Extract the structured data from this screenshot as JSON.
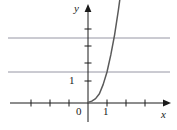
{
  "figure": {
    "title": "",
    "background_color": "#ffffff",
    "axis_color": "#1a1a1a",
    "grid_color": "#8a8a9a",
    "curve_color": "#5a5a5a"
  },
  "labels": {
    "y_axis": "y",
    "x_axis": "x",
    "origin": "0",
    "x_tick_one": "1",
    "y_tick_one": "1"
  },
  "chart_data": {
    "type": "line",
    "title": "",
    "xlabel": "x",
    "ylabel": "y",
    "xlim": [
      -3.7,
      4.1
    ],
    "ylim": [
      -0.35,
      5.0
    ],
    "grid": true,
    "grid_position": "horizontal",
    "gridlines_y": [
      2,
      4
    ],
    "legend": false,
    "x_ticks": [
      -3,
      -2,
      -1,
      0,
      1,
      2,
      3
    ],
    "x_tick_labels": [
      "",
      "",
      "",
      "0",
      "1",
      "",
      ""
    ],
    "y_ticks": [
      1,
      2,
      3,
      4
    ],
    "y_tick_labels": [
      "1",
      "",
      "",
      ""
    ],
    "series": [
      {
        "name": "exponential curve",
        "x": [
          0.0,
          0.2,
          0.4,
          0.6,
          0.8,
          1.0,
          1.2,
          1.4,
          1.6,
          1.8,
          2.0,
          2.1
        ],
        "y": [
          0.02,
          0.06,
          0.14,
          0.3,
          0.6,
          1.0,
          1.55,
          2.2,
          3.0,
          3.9,
          4.85,
          5.0
        ]
      }
    ]
  }
}
